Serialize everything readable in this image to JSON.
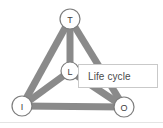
{
  "canvas": {
    "width": 163,
    "height": 128,
    "background": "#ffffff",
    "bottom_rule_y": 122,
    "bottom_rule_color": "#e4e4e4"
  },
  "diagram": {
    "type": "graph",
    "edge_color": "#8a8a8a",
    "edge_width": 7,
    "node_ring_color": "#7d7d7d",
    "node_fill": "#ffffff",
    "node_text_color": "#3d3d3d",
    "nodes": [
      {
        "id": "T",
        "label": "T",
        "x": 70,
        "y": 19,
        "r": 10
      },
      {
        "id": "L",
        "label": "L",
        "x": 70,
        "y": 71,
        "r": 9
      },
      {
        "id": "I",
        "label": "I",
        "x": 22,
        "y": 106,
        "r": 10
      },
      {
        "id": "O",
        "label": "O",
        "x": 124,
        "y": 107,
        "r": 10
      }
    ],
    "edges": [
      {
        "from": "T",
        "to": "I"
      },
      {
        "from": "T",
        "to": "O"
      },
      {
        "from": "T",
        "to": "L"
      },
      {
        "from": "I",
        "to": "L"
      },
      {
        "from": "L",
        "to": "O"
      },
      {
        "from": "I",
        "to": "O"
      }
    ]
  },
  "tooltip": {
    "text": "Life cycle",
    "x": 78,
    "y": 64,
    "width": 80,
    "height": 24,
    "background": "#ffffff",
    "border_color": "#c9c9c9",
    "text_color": "#4a4a4a",
    "anchor_node": "L"
  }
}
